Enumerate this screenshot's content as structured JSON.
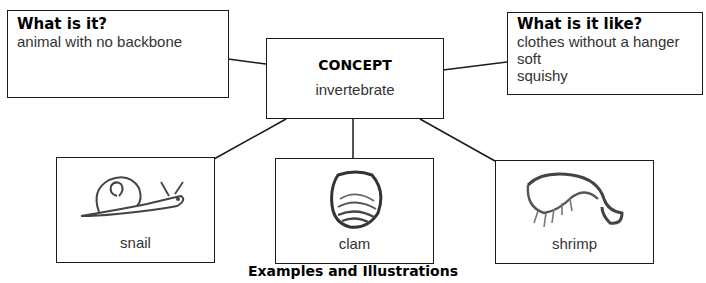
{
  "what_is_it": {
    "heading": "What is it?",
    "lines": [
      "animal with no backbone"
    ]
  },
  "concept": {
    "heading": "CONCEPT",
    "value": "invertebrate"
  },
  "what_is_it_like": {
    "heading": "What is it like?",
    "lines": [
      "clothes without a hanger",
      "soft",
      "squishy"
    ]
  },
  "examples": [
    {
      "label": "snail",
      "icon": "snail-drawing"
    },
    {
      "label": "clam",
      "icon": "clam-drawing"
    },
    {
      "label": "shrimp",
      "icon": "shrimp-drawing"
    }
  ],
  "caption": "Examples and Illustrations"
}
